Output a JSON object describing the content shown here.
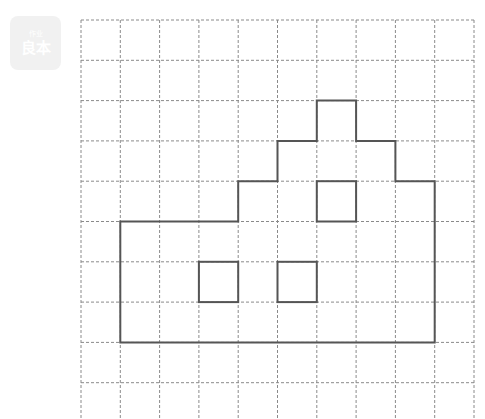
{
  "badge": {
    "top_text": "作业",
    "main_text": "良本",
    "bg_color": "#f1f1f1"
  },
  "grid": {
    "origin_x": 81,
    "origin_y": 20,
    "cell_w": 39.3,
    "cell_h": 40.3,
    "cols": 10,
    "rows": 10,
    "line_color": "#8a8a8a",
    "dash": "3,2"
  },
  "figure": {
    "stroke_color": "#555555",
    "stroke_width": 2,
    "outline": [
      [
        1,
        5
      ],
      [
        4,
        5
      ],
      [
        4,
        4
      ],
      [
        5,
        4
      ],
      [
        5,
        3
      ],
      [
        6,
        3
      ],
      [
        6,
        2
      ],
      [
        7,
        2
      ],
      [
        7,
        3
      ],
      [
        8,
        3
      ],
      [
        8,
        4
      ],
      [
        9,
        4
      ],
      [
        9,
        8
      ],
      [
        1,
        8
      ]
    ],
    "inner_squares": [
      {
        "x": 6,
        "y": 4,
        "w": 1,
        "h": 1
      },
      {
        "x": 3,
        "y": 6,
        "w": 1,
        "h": 1
      },
      {
        "x": 5,
        "y": 6,
        "w": 1,
        "h": 1
      }
    ]
  }
}
